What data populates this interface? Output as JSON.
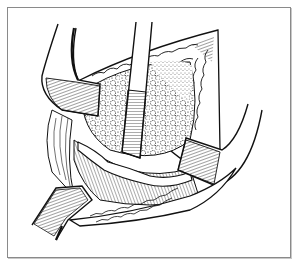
{
  "figure": {
    "frame_color": "#8a8a8a",
    "ink_color": "#111111",
    "background": "#ffffff",
    "elements": [
      {
        "name": "upper-left-retractor"
      },
      {
        "name": "center-vertical-retractor"
      },
      {
        "name": "right-retractor"
      },
      {
        "name": "lower-left-retractor"
      },
      {
        "name": "granular-tissue-mass"
      },
      {
        "name": "upper-skin-flap"
      },
      {
        "name": "lower-skin-flap"
      },
      {
        "name": "vessel-band"
      }
    ]
  }
}
